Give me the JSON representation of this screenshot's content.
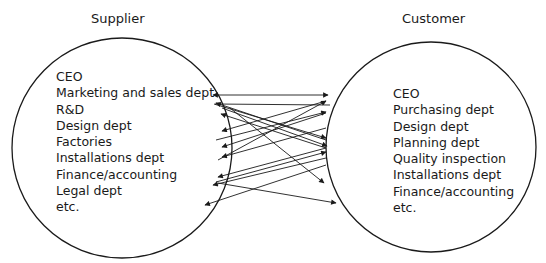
{
  "supplier": {
    "title": "Supplier",
    "items": [
      "CEO",
      "Marketing and sales dept",
      "R&D",
      "Design dept",
      "Factories",
      "Installations dept",
      "Finance/accounting",
      "Legal dept",
      "etc."
    ]
  },
  "customer": {
    "title": "Customer",
    "items": [
      "CEO",
      "Purchasing dept",
      "Design dept",
      "Planning dept",
      "Quality inspection",
      "Installations dept",
      "Finance/accounting",
      "etc."
    ]
  },
  "colors": {
    "line": "#1a1a1a",
    "background": "#ffffff"
  }
}
